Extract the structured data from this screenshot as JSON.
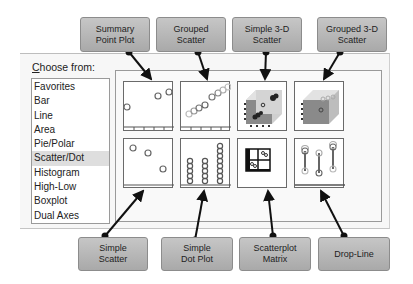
{
  "dialog": {
    "choose_from": {
      "accel": "C",
      "rest": "hoose from:"
    },
    "chart_types": [
      {
        "label": "Favorites",
        "selected": false
      },
      {
        "label": "Bar",
        "selected": false
      },
      {
        "label": "Line",
        "selected": false
      },
      {
        "label": "Area",
        "selected": false
      },
      {
        "label": "Pie/Polar",
        "selected": false
      },
      {
        "label": "Scatter/Dot",
        "selected": true
      },
      {
        "label": "Histogram",
        "selected": false
      },
      {
        "label": "High-Low",
        "selected": false
      },
      {
        "label": "Boxplot",
        "selected": false
      },
      {
        "label": "Dual Axes",
        "selected": false
      }
    ],
    "gallery": [
      {
        "id": "summary-point-plot",
        "icon": "summary-point-plot-icon"
      },
      {
        "id": "grouped-scatter",
        "icon": "grouped-scatter-icon"
      },
      {
        "id": "simple-3d-scatter",
        "icon": "simple-3d-scatter-icon"
      },
      {
        "id": "grouped-3d-scatter",
        "icon": "grouped-3d-scatter-icon"
      },
      {
        "id": "simple-scatter",
        "icon": "simple-scatter-icon"
      },
      {
        "id": "simple-dot-plot",
        "icon": "simple-dot-plot-icon"
      },
      {
        "id": "scatterplot-matrix",
        "icon": "scatterplot-matrix-icon"
      },
      {
        "id": "drop-line",
        "icon": "drop-line-icon"
      }
    ]
  },
  "callouts": {
    "top": [
      {
        "line1": "Summary",
        "line2": "Point Plot"
      },
      {
        "line1": "Grouped",
        "line2": "Scatter"
      },
      {
        "line1": "Simple 3-D",
        "line2": "Scatter"
      },
      {
        "line1": "Grouped 3-D",
        "line2": "Scatter"
      }
    ],
    "bottom": [
      {
        "line1": "Simple",
        "line2": "Scatter"
      },
      {
        "line1": "Simple",
        "line2": "Dot Plot"
      },
      {
        "line1": "Scatterplot",
        "line2": "Matrix"
      },
      {
        "line1": "Drop-Line",
        "line2": ""
      }
    ]
  },
  "colors": {
    "callout_fill": "#b8b8b8",
    "selection": "#dedede",
    "cube_front": "#cfcfcf",
    "cube_side": "#8a8a8a"
  }
}
